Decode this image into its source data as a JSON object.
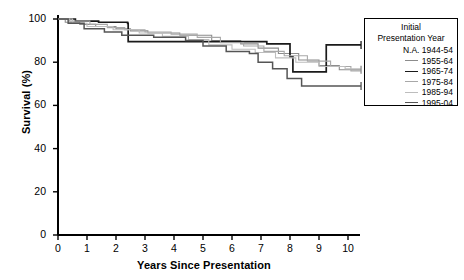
{
  "chart_data": {
    "type": "line",
    "title": "",
    "xlabel": "Years Since Presentation",
    "ylabel": "Survival (%)",
    "xlim": [
      0,
      10.6
    ],
    "ylim": [
      0,
      100
    ],
    "xticks": [
      0,
      1,
      2,
      3,
      4,
      5,
      6,
      7,
      8,
      9,
      10
    ],
    "yticks": [
      0,
      20,
      40,
      60,
      80,
      100
    ],
    "grid": false,
    "step_style": "post",
    "legend": {
      "position": "top-right",
      "title_lines": [
        "Initial",
        "Presentation Year"
      ],
      "entries": [
        {
          "label": "N.A. 1944-54",
          "color": "none",
          "has_swatch": false
        },
        {
          "label": "1955-64",
          "color": "#8c8c8c",
          "has_swatch": true
        },
        {
          "label": "1965-74",
          "color": "#1a1a1a",
          "has_swatch": true
        },
        {
          "label": "1975-84",
          "color": "#a8a8a8",
          "has_swatch": true
        },
        {
          "label": "1985-94",
          "color": "#bdbdbd",
          "has_swatch": true
        },
        {
          "label": "1995-04",
          "color": "#555555",
          "has_swatch": true
        }
      ]
    },
    "series": [
      {
        "name": "1955-64",
        "color": "#8c8c8c",
        "width": 1.1,
        "points": [
          [
            0,
            100
          ],
          [
            0.25,
            98.5
          ],
          [
            0.75,
            97.5
          ],
          [
            1.3,
            96.5
          ],
          [
            2.0,
            95.5
          ],
          [
            2.5,
            94.5
          ],
          [
            3.1,
            93.5
          ],
          [
            4.2,
            92.5
          ],
          [
            5.3,
            90.0
          ],
          [
            6.3,
            88.5
          ],
          [
            6.9,
            86.5
          ],
          [
            7.6,
            84.0
          ],
          [
            8.3,
            81.0
          ],
          [
            9.0,
            78.5
          ],
          [
            9.7,
            76.5
          ],
          [
            10.45,
            76.5
          ]
        ]
      },
      {
        "name": "1965-74",
        "color": "#1a1a1a",
        "width": 1.7,
        "points": [
          [
            0,
            100
          ],
          [
            0.6,
            99.0
          ],
          [
            1.4,
            98.5
          ],
          [
            2.4,
            98.0
          ],
          [
            2.42,
            89.5
          ],
          [
            6.6,
            89.5
          ],
          [
            7.2,
            88.5
          ],
          [
            8.0,
            82.5
          ],
          [
            8.1,
            75.5
          ],
          [
            9.2,
            75.5
          ],
          [
            9.25,
            88.0
          ],
          [
            10.45,
            88.0
          ]
        ]
      },
      {
        "name": "1975-84",
        "color": "#a8a8a8",
        "width": 1.1,
        "points": [
          [
            0,
            100
          ],
          [
            0.4,
            99.0
          ],
          [
            1.1,
            97.5
          ],
          [
            1.7,
            96.0
          ],
          [
            2.3,
            95.0
          ],
          [
            3.0,
            94.0
          ],
          [
            3.9,
            93.0
          ],
          [
            4.8,
            91.5
          ],
          [
            5.6,
            89.0
          ],
          [
            6.4,
            87.5
          ],
          [
            7.1,
            85.0
          ],
          [
            7.8,
            83.0
          ],
          [
            8.6,
            80.5
          ],
          [
            9.4,
            78.0
          ],
          [
            10.1,
            76.0
          ],
          [
            10.45,
            76.0
          ]
        ]
      },
      {
        "name": "1985-94",
        "color": "#bdbdbd",
        "width": 1.1,
        "points": [
          [
            0,
            100
          ],
          [
            0.5,
            98.0
          ],
          [
            1.0,
            96.5
          ],
          [
            1.9,
            95.0
          ],
          [
            2.8,
            93.5
          ],
          [
            3.6,
            92.0
          ],
          [
            4.5,
            90.5
          ],
          [
            5.2,
            88.0
          ],
          [
            6.0,
            86.0
          ],
          [
            6.8,
            84.5
          ],
          [
            7.5,
            82.0
          ],
          [
            8.2,
            80.0
          ],
          [
            9.0,
            78.0
          ],
          [
            9.9,
            77.0
          ],
          [
            10.45,
            77.0
          ]
        ]
      },
      {
        "name": "1995-04",
        "color": "#555555",
        "width": 1.5,
        "points": [
          [
            0,
            100
          ],
          [
            0.35,
            98.0
          ],
          [
            0.9,
            95.5
          ],
          [
            1.6,
            94.0
          ],
          [
            2.2,
            92.5
          ],
          [
            3.3,
            91.5
          ],
          [
            4.4,
            90.0
          ],
          [
            5.0,
            87.5
          ],
          [
            5.8,
            85.0
          ],
          [
            6.6,
            84.0
          ],
          [
            6.9,
            80.0
          ],
          [
            7.4,
            77.0
          ],
          [
            7.9,
            72.5
          ],
          [
            8.4,
            69.0
          ],
          [
            10.45,
            69.0
          ]
        ]
      }
    ],
    "censor_marks": [
      {
        "x": 10.45,
        "y": 88.0,
        "color": "#1a1a1a"
      },
      {
        "x": 10.45,
        "y": 76.5,
        "color": "#8c8c8c"
      },
      {
        "x": 10.45,
        "y": 69.0,
        "color": "#555555"
      }
    ]
  }
}
